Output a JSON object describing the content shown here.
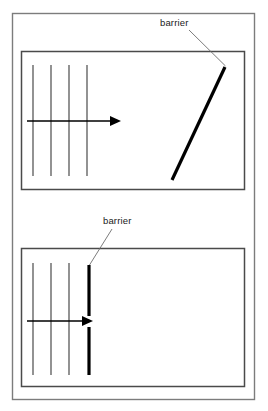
{
  "figure": {
    "background_color": "#ffffff",
    "outer_frame": {
      "x": 12.5,
      "y": 13.5,
      "width": 242,
      "height": 386,
      "stroke_color": "#7c7c7c"
    },
    "panels": [
      {
        "id": "top-panel",
        "name": "oblique-barrier-panel",
        "box": {
          "x": 21.5,
          "y": 51.5,
          "width": 223,
          "height": 138
        },
        "stroke_color": "#4a4a4a",
        "wavefronts": {
          "count": 4,
          "x_positions": [
            33,
            51,
            69,
            87
          ],
          "y_top": 65,
          "y_bottom": 176,
          "stroke_color": "#3a3a3a"
        },
        "propagation_arrow": {
          "x_start": 27,
          "x_end": 121,
          "y": 121,
          "head_length": 11,
          "head_half_width": 5,
          "stroke_color": "#000000"
        },
        "barrier": {
          "type": "oblique",
          "x1": 172,
          "y1": 180,
          "x2": 225,
          "y2": 67,
          "stroke_color": "#000000"
        },
        "annotation": {
          "label": "barrier",
          "text_x": 160,
          "text_y": 26,
          "leader": {
            "x1": 189,
            "y1": 30,
            "x2": 225.5,
            "y2": 66
          },
          "leader_color": "#6d6d6d"
        }
      },
      {
        "id": "bottom-panel",
        "name": "single-slit-barrier-panel",
        "box": {
          "x": 21.5,
          "y": 248.5,
          "width": 223,
          "height": 138
        },
        "stroke_color": "#4a4a4a",
        "wavefronts": {
          "count": 3,
          "x_positions": [
            33,
            51,
            69
          ],
          "y_top": 263,
          "y_bottom": 375,
          "stroke_color": "#3a3a3a"
        },
        "propagation_arrow": {
          "x_start": 27,
          "x_end": 93,
          "y": 321,
          "head_length": 11,
          "head_half_width": 5,
          "stroke_color": "#000000"
        },
        "barrier": {
          "type": "slit",
          "x": 89,
          "upper_segment": {
            "y1": 265,
            "y2": 316
          },
          "lower_segment": {
            "y1": 327,
            "y2": 375
          },
          "slit_gap": {
            "y1": 316,
            "y2": 327
          },
          "stroke_color": "#000000"
        },
        "annotation": {
          "label": "barrier",
          "text_x": 103,
          "text_y": 224,
          "leader": {
            "x1": 112,
            "y1": 229,
            "x2": 89.5,
            "y2": 265
          },
          "leader_color": "#6d6d6d"
        }
      }
    ]
  }
}
